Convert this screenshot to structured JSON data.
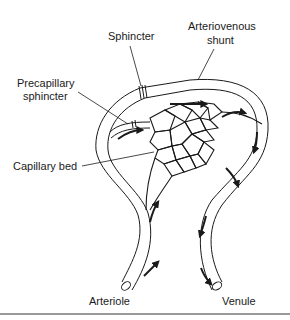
{
  "figure": {
    "labels": {
      "sphincter": "Sphincter",
      "shunt_line1": "Arteriovenous",
      "shunt_line2": "shunt",
      "precap_line1": "Precapillary",
      "precap_line2": "sphincter",
      "capillary_bed": "Capillary bed",
      "arteriole": "Arteriole",
      "venule": "Venule"
    },
    "colors": {
      "ink": "#1a1a1a",
      "vessel_fill": "#ffffff",
      "rule": "#9a9a9a"
    },
    "flow_arrows": [
      "arteriole-inflow-lower",
      "arteriole-inflow-upper",
      "precapillary-entry",
      "shunt-top",
      "shunt-exit",
      "venule-right-down",
      "capillary-outflow",
      "venule-mid-down",
      "venule-outflow"
    ]
  }
}
